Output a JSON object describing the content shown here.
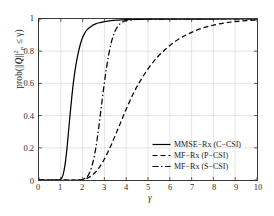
{
  "chart_data": {
    "type": "line",
    "title": "",
    "xlabel": "γ",
    "ylabel_text": "prob(||Q||²F ≤ γ)",
    "xlim": [
      0,
      10
    ],
    "ylim": [
      0,
      1
    ],
    "grid": true,
    "xticks": [
      "0",
      "1",
      "2",
      "3",
      "4",
      "5",
      "6",
      "7",
      "8",
      "9",
      "10"
    ],
    "yticks": [
      "0",
      "0.2",
      "0.4",
      "0.6",
      "0.8",
      "1"
    ],
    "legend_position": "lower right",
    "series": [
      {
        "name": "MMSE−Rx (C−CSI)",
        "style": "solid",
        "color": "#000000",
        "x": [
          0.0,
          0.6,
          0.9,
          1.0,
          1.1,
          1.2,
          1.3,
          1.4,
          1.5,
          1.6,
          1.7,
          1.8,
          1.9,
          2.0,
          2.1,
          2.2,
          2.4,
          2.6,
          2.8,
          3.0,
          3.3,
          3.6,
          4.0,
          4.5,
          5.0,
          6.0,
          7.0,
          8.0,
          9.0,
          10.0
        ],
        "y": [
          0.0,
          0.0,
          0.0,
          0.005,
          0.03,
          0.1,
          0.22,
          0.37,
          0.51,
          0.63,
          0.72,
          0.79,
          0.845,
          0.885,
          0.912,
          0.932,
          0.955,
          0.97,
          0.978,
          0.984,
          0.99,
          0.993,
          0.9955,
          0.9975,
          0.9985,
          0.9994,
          0.9997,
          0.9999,
          1.0,
          1.0
        ]
      },
      {
        "name": "MF−Rx (P−CSI)",
        "style": "dashed",
        "color": "#000000",
        "x": [
          0.0,
          1.5,
          2.0,
          2.2,
          2.4,
          2.6,
          2.8,
          3.0,
          3.2,
          3.4,
          3.6,
          3.8,
          4.0,
          4.3,
          4.6,
          5.0,
          5.4,
          5.8,
          6.2,
          6.6,
          7.0,
          7.5,
          8.0,
          8.5,
          9.0,
          9.5,
          10.0
        ],
        "y": [
          0.0,
          0.0,
          0.003,
          0.01,
          0.025,
          0.05,
          0.085,
          0.13,
          0.185,
          0.245,
          0.31,
          0.375,
          0.44,
          0.53,
          0.605,
          0.69,
          0.758,
          0.812,
          0.856,
          0.89,
          0.917,
          0.944,
          0.962,
          0.975,
          0.984,
          0.99,
          0.994
        ]
      },
      {
        "name": "MF−Rx (S−CSI)",
        "style": "dashdot",
        "color": "#000000",
        "x": [
          0.0,
          1.8,
          2.0,
          2.2,
          2.3,
          2.4,
          2.5,
          2.6,
          2.7,
          2.8,
          2.9,
          3.0,
          3.1,
          3.2,
          3.3,
          3.4,
          3.5,
          3.6,
          3.7,
          3.8,
          4.0,
          4.5,
          5.0,
          6.0,
          8.0,
          10.0
        ],
        "y": [
          0.0,
          0.0,
          0.004,
          0.02,
          0.04,
          0.075,
          0.125,
          0.195,
          0.285,
          0.39,
          0.5,
          0.605,
          0.7,
          0.78,
          0.845,
          0.893,
          0.928,
          0.952,
          0.968,
          0.979,
          0.99,
          0.9975,
          0.9992,
          1.0,
          1.0,
          1.0
        ]
      }
    ]
  },
  "legend": {
    "items": [
      {
        "label": "MMSE−Rx (C−CSI)",
        "style": "solid"
      },
      {
        "label": "MF−Rx (P−CSI)",
        "style": "dashed"
      },
      {
        "label": "MF−Rx (S−CSI)",
        "style": "dashdot"
      }
    ]
  },
  "ylabel_parts": {
    "prefix": "prob(||",
    "symbol": "Q",
    "norm": "||",
    "sup": "2",
    "sub": "F",
    "suffix": " ≤ γ)"
  }
}
